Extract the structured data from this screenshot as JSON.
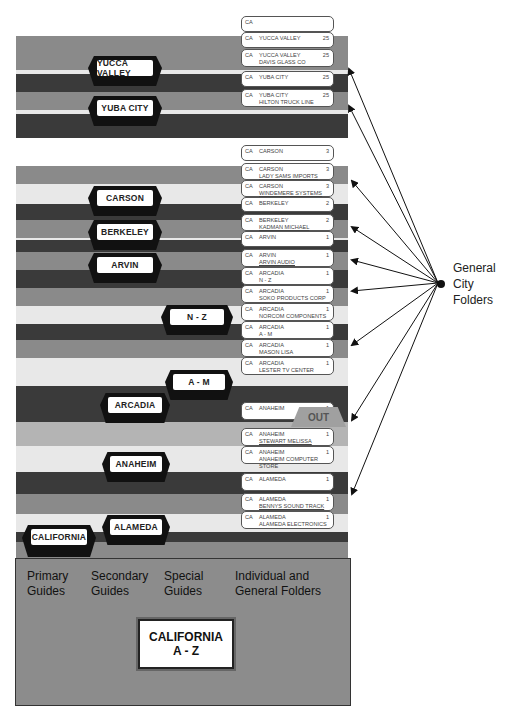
{
  "guides": {
    "yucca_valley": "YUCCA VALLEY",
    "yuba_city": "YUBA CITY",
    "carson": "CARSON",
    "berkeley": "BERKELEY",
    "arvin": "ARVIN",
    "n_z": "N - Z",
    "a_m": "A - M",
    "arcadia": "ARCADIA",
    "anaheim": "ANAHEIM",
    "alameda": "ALAMEDA",
    "california": "CALIFORNIA"
  },
  "folders": [
    {
      "ca": "CA",
      "name": "",
      "name2": "",
      "num": ""
    },
    {
      "ca": "CA",
      "name": "YUCCA VALLEY",
      "name2": "",
      "num": "25"
    },
    {
      "ca": "CA",
      "name": "YUCCA VALLEY",
      "name2": "DAVIS GLASS CO",
      "num": "25"
    },
    {
      "ca": "CA",
      "name": "YUBA CITY",
      "name2": "",
      "num": "25"
    },
    {
      "ca": "CA",
      "name": "YUBA CITY",
      "name2": "HILTON TRUCK LINE",
      "num": "25"
    },
    {
      "ca": "CA",
      "name": "CARSON",
      "name2": "",
      "num": "3"
    },
    {
      "ca": "CA",
      "name": "CARSON",
      "name2": "LADY SAMS IMPORTS",
      "num": "3"
    },
    {
      "ca": "CA",
      "name": "CARSON",
      "name2": "WINDEMERE SYSTEMS",
      "num": "3"
    },
    {
      "ca": "CA",
      "name": "BERKELEY",
      "name2": "",
      "num": "2"
    },
    {
      "ca": "CA",
      "name": "BERKELEY",
      "name2": "KADMAN MICHAEL",
      "num": "2"
    },
    {
      "ca": "CA",
      "name": "ARVIN",
      "name2": "",
      "num": "1"
    },
    {
      "ca": "CA",
      "name": "ARVIN",
      "name2": "ARVIN AUDIO",
      "num": "1"
    },
    {
      "ca": "CA",
      "name": "ARCADIA",
      "name2": "N - Z",
      "num": "1"
    },
    {
      "ca": "CA",
      "name": "ARCADIA",
      "name2": "SOKO PRODUCTS CORP",
      "num": "1"
    },
    {
      "ca": "CA",
      "name": "ARCADIA",
      "name2": "NORCOM COMPONENTS",
      "num": "1"
    },
    {
      "ca": "CA",
      "name": "ARCADIA",
      "name2": "A - M",
      "num": "1"
    },
    {
      "ca": "CA",
      "name": "ARCADIA",
      "name2": "MASON LISA",
      "num": "1"
    },
    {
      "ca": "CA",
      "name": "ARCADIA",
      "name2": "LESTER TV CENTER",
      "num": "1"
    },
    {
      "ca": "CA",
      "name": "ANAHEIM",
      "name2": "",
      "num": "1"
    },
    {
      "ca": "CA",
      "name": "ANAHEIM",
      "name2": "STEWART MELISSA",
      "num": "1"
    },
    {
      "ca": "CA",
      "name": "ANAHEIM",
      "name2": "ANAHEIM COMPUTER STORE",
      "num": "1"
    },
    {
      "ca": "CA",
      "name": "ALAMEDA",
      "name2": "",
      "num": "1"
    },
    {
      "ca": "CA",
      "name": "ALAMEDA",
      "name2": "BENNYS SOUND TRACK",
      "num": "1"
    },
    {
      "ca": "CA",
      "name": "ALAMEDA",
      "name2": "ALAMEDA ELECTRONICS",
      "num": "1"
    }
  ],
  "out_guide": "OUT",
  "base": {
    "primary": [
      "Primary",
      "Guides"
    ],
    "secondary": [
      "Secondary",
      "Guides"
    ],
    "special": [
      "Special",
      "Guides"
    ],
    "individual": [
      "Individual and",
      "General Folders"
    ],
    "label": [
      "CALIFORNIA",
      "A - Z"
    ]
  },
  "annotation": [
    "General",
    "City",
    "Folders"
  ]
}
